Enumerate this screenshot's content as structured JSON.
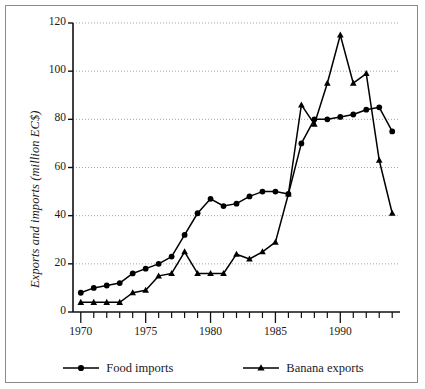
{
  "chart_data": {
    "type": "line",
    "title": "",
    "xlabel": "",
    "ylabel": "Exports and imports (million EC$)",
    "xlim": [
      1969.4,
      1994.6
    ],
    "ylim": [
      0,
      120
    ],
    "ytick_labels": [
      "0",
      "20",
      "40",
      "60",
      "80",
      "100",
      "120"
    ],
    "ytick_values": [
      0,
      20,
      40,
      60,
      80,
      100,
      120
    ],
    "xtick_labels": [
      "1970",
      "1975",
      "1980",
      "1985",
      "1990"
    ],
    "xtick_values": [
      1970,
      1975,
      1980,
      1985,
      1990
    ],
    "xtick_minor_values": [
      1971,
      1972,
      1973,
      1974,
      1976,
      1977,
      1978,
      1979,
      1981,
      1982,
      1983,
      1984,
      1986,
      1987,
      1988,
      1989,
      1991,
      1992,
      1993,
      1994
    ],
    "grid": "horizontal-dotted",
    "legend_position": "bottom-center",
    "x": [
      1970,
      1971,
      1972,
      1973,
      1974,
      1975,
      1976,
      1977,
      1978,
      1979,
      1980,
      1981,
      1982,
      1983,
      1984,
      1985,
      1986,
      1987,
      1988,
      1989,
      1990,
      1991,
      1992,
      1993,
      1994
    ],
    "series": [
      {
        "name": "Food imports",
        "marker": "circle",
        "color": "#000000",
        "values": [
          8,
          10,
          11,
          12,
          16,
          18,
          20,
          23,
          32,
          41,
          47,
          44,
          45,
          48,
          50,
          50,
          49,
          70,
          80,
          80,
          81,
          82,
          84,
          85,
          75
        ]
      },
      {
        "name": "Banana exports",
        "marker": "triangle",
        "color": "#000000",
        "values": [
          4,
          4,
          4,
          4,
          8,
          9,
          15,
          16,
          25,
          16,
          16,
          16,
          24,
          22,
          25,
          29,
          49,
          86,
          78,
          95,
          115,
          95,
          99,
          63,
          41
        ]
      }
    ]
  },
  "legend": {
    "items": [
      {
        "label": "Food imports",
        "marker": "circle-marker"
      },
      {
        "label": "Banana exports",
        "marker": "triangle-marker"
      }
    ]
  }
}
